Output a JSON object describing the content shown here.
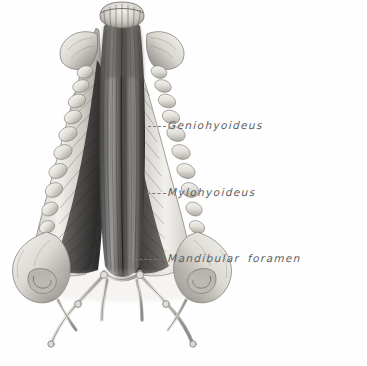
{
  "figure": {
    "kind": "anatomical-illustration",
    "view": "ventral view of mandible with jaw and hyoid musculature",
    "background_color": "#fefefe",
    "ink_color": "#5d5d5d",
    "leader_color": "#77747a",
    "muscle_dark": "#2b2b2b",
    "bone_light": "#e8e6e2"
  },
  "labels": [
    {
      "id": "geniohyoideus",
      "text": "Geniohyoideus",
      "leader": "dashed"
    },
    {
      "id": "mylohyoideus",
      "text": "Mylohyoideus",
      "leader": "dashed"
    },
    {
      "id": "mandibular_foramen",
      "text": "Mandibular  foramen",
      "leader": "dashed"
    }
  ]
}
